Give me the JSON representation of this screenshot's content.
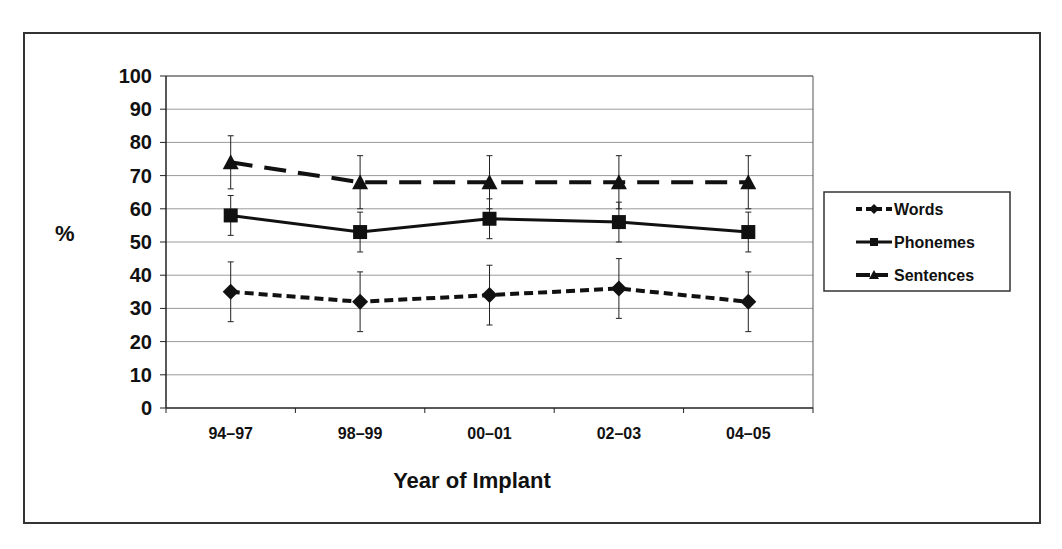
{
  "chart_data": {
    "type": "line",
    "title": "",
    "xlabel": "Year of Implant",
    "ylabel": "%",
    "ylim": [
      0,
      100
    ],
    "yticks": [
      0,
      10,
      20,
      30,
      40,
      50,
      60,
      70,
      80,
      90,
      100
    ],
    "grid": true,
    "legend_position": "right",
    "categories": [
      "94–97",
      "98–99",
      "00–01",
      "02–03",
      "04–05"
    ],
    "series": [
      {
        "name": "Words",
        "marker": "diamond",
        "line": "short-dash",
        "values": [
          35,
          32,
          34,
          36,
          32
        ],
        "error": [
          9,
          9,
          9,
          9,
          9
        ]
      },
      {
        "name": "Phonemes",
        "marker": "square",
        "line": "solid",
        "values": [
          58,
          53,
          57,
          56,
          53
        ],
        "error": [
          6,
          6,
          6,
          6,
          6
        ]
      },
      {
        "name": "Sentences",
        "marker": "triangle",
        "line": "long-dash",
        "values": [
          74,
          68,
          68,
          68,
          68
        ],
        "error": [
          8,
          8,
          8,
          8,
          8
        ]
      }
    ]
  },
  "colors": {
    "line": "#111111",
    "grid": "#9a9a9a",
    "frame": "#333333"
  }
}
